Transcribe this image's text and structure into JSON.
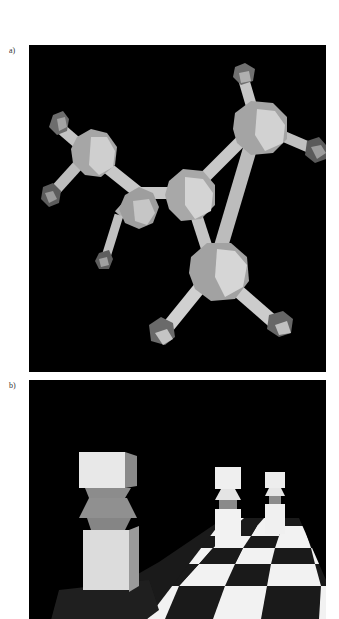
{
  "figure": {
    "panels": [
      {
        "label": "a)",
        "description": "3D ball-and-stick molecular model rendering with polyhedral atoms",
        "colors": {
          "background": "#000000",
          "atom_light": "#d8d8d8",
          "atom_mid": "#a8a8a8",
          "atom_dark": "#6a6a6a",
          "bond": "#c8c8c8"
        }
      },
      {
        "label": "b)",
        "description": "3D rendered chess pieces standing on a checkerboard receding into the distance",
        "colors": {
          "background": "#000000",
          "square_light": "#f2f2f2",
          "square_dark": "#1a1a1a",
          "piece_light": "#ececec",
          "piece_shadow": "#8a8a8a"
        }
      }
    ]
  }
}
